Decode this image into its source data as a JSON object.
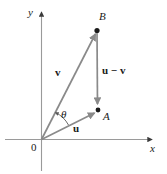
{
  "figure": {
    "name": "vector-subtraction-diagram",
    "colors": {
      "axis": "#9a9a9a",
      "vector": "#8a8a8a",
      "point": "#1a1a1a",
      "text": "#1a1a1a",
      "background": "#ffffff"
    },
    "axes": {
      "x_label": "x",
      "y_label": "y",
      "origin_label": "0"
    },
    "points": [
      {
        "id": "A",
        "label": "A",
        "x": 98,
        "y": 110
      },
      {
        "id": "B",
        "label": "B",
        "x": 97,
        "y": 30
      }
    ],
    "vectors": [
      {
        "id": "u",
        "label": "u",
        "from": "origin",
        "to": "A"
      },
      {
        "id": "v",
        "label": "v",
        "from": "origin",
        "to": "B"
      },
      {
        "id": "u-minus-v",
        "label": "u − v",
        "from": "B",
        "to": "A"
      }
    ],
    "angle": {
      "label": "θ",
      "between": [
        "u",
        "v"
      ]
    }
  }
}
